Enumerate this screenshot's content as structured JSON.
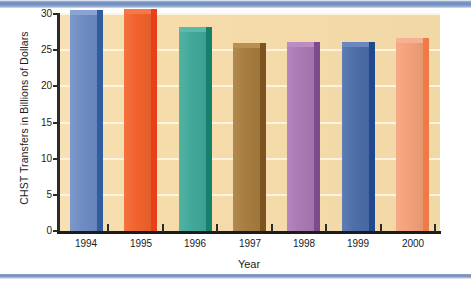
{
  "chart_data": {
    "type": "bar",
    "title": "",
    "xlabel": "Year",
    "ylabel": "CHST Transfers in Billions of Dollars",
    "categories": [
      "1994",
      "1995",
      "1996",
      "1997",
      "1998",
      "1999",
      "2000"
    ],
    "values": [
      29.8,
      30.0,
      27.5,
      25.3,
      25.4,
      25.4,
      26.0
    ],
    "series": [
      {
        "name": "CHST Transfers",
        "values": [
          29.8,
          30.0,
          27.5,
          25.3,
          25.4,
          25.4,
          26.0
        ]
      }
    ],
    "bar_colors": [
      "#6e8cc4",
      "#f2632c",
      "#41a99a",
      "#a87d3f",
      "#ab7ab4",
      "#4d6eaa",
      "#f4a179"
    ],
    "bar_side_colors": [
      "#2f5da0",
      "#e8401a",
      "#16806f",
      "#7d5420",
      "#7d4a8c",
      "#1f4a8f",
      "#ef7a45"
    ],
    "bar_top_colors": [
      "#8aa3d2",
      "#f5784a",
      "#5cb9ab",
      "#b98f52",
      "#bb8ec3",
      "#6a88bd",
      "#f6b195"
    ],
    "ylim": [
      0,
      30
    ],
    "yticks": [
      0,
      5,
      10,
      15,
      20,
      25,
      30
    ],
    "ytick_labels": [
      "0",
      "5",
      "10",
      "15",
      "20",
      "25",
      "30"
    ],
    "grid": true,
    "grid_axis": "y",
    "legend": "none",
    "plot_background": "#f6dcaa",
    "gridline_color": "#fdf4e2",
    "axis_color": "#1c1c1c",
    "figure_background": "#ffffff"
  },
  "decor": {
    "top_band_color": "#7e9ac8",
    "bottom_band_color": "#7489b5"
  }
}
